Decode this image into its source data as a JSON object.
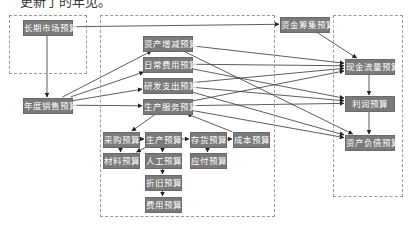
{
  "top_text": "更新了的年见。",
  "groups": [
    {
      "id": "left",
      "x": 9,
      "y": 15,
      "w": 76,
      "h": 57
    },
    {
      "id": "middle",
      "x": 100,
      "y": 15,
      "w": 173,
      "h": 200
    },
    {
      "id": "right",
      "x": 333,
      "y": 15,
      "w": 68,
      "h": 180
    }
  ],
  "nodes": [
    {
      "id": "long_market",
      "label": "长期市场预算",
      "x": 23,
      "y": 20,
      "w": 48
    },
    {
      "id": "annual_sales",
      "label": "年度销售预算",
      "x": 23,
      "y": 98,
      "w": 48
    },
    {
      "id": "asset_change",
      "label": "资产增减预算",
      "x": 143,
      "y": 36,
      "w": 48
    },
    {
      "id": "daily_expense",
      "label": "日常费用预算",
      "x": 143,
      "y": 57,
      "w": 48
    },
    {
      "id": "rd_expense",
      "label": "研发支出预算",
      "x": 143,
      "y": 78,
      "w": 48
    },
    {
      "id": "production_service",
      "label": "生产服务预算",
      "x": 143,
      "y": 99,
      "w": 48
    },
    {
      "id": "procurement",
      "label": "采购预算",
      "x": 103,
      "y": 132,
      "w": 35
    },
    {
      "id": "production",
      "label": "生产预算",
      "x": 145,
      "y": 132,
      "w": 35
    },
    {
      "id": "inventory",
      "label": "存货预算",
      "x": 190,
      "y": 132,
      "w": 35
    },
    {
      "id": "cost",
      "label": "成本预算",
      "x": 233,
      "y": 132,
      "w": 35
    },
    {
      "id": "material",
      "label": "材料预算",
      "x": 103,
      "y": 153,
      "w": 35
    },
    {
      "id": "labor",
      "label": "人工预算",
      "x": 145,
      "y": 153,
      "w": 35
    },
    {
      "id": "payable",
      "label": "应付预算",
      "x": 190,
      "y": 153,
      "w": 35
    },
    {
      "id": "depreciation",
      "label": "折旧预算",
      "x": 145,
      "y": 175,
      "w": 35
    },
    {
      "id": "expense",
      "label": "费用预算",
      "x": 145,
      "y": 197,
      "w": 35
    },
    {
      "id": "fund_raising",
      "label": "资金筹集预算",
      "x": 280,
      "y": 17,
      "w": 48
    },
    {
      "id": "cash_flow",
      "label": "现金流量预算",
      "x": 345,
      "y": 59,
      "w": 48
    },
    {
      "id": "profit",
      "label": "利润预算",
      "x": 345,
      "y": 96,
      "w": 48
    },
    {
      "id": "balance_sheet",
      "label": "资产负债预算",
      "x": 345,
      "y": 135,
      "w": 48
    }
  ],
  "edges": [
    [
      "long_market",
      "fund_raising"
    ],
    [
      "long_market",
      "annual_sales"
    ],
    [
      "annual_sales",
      "asset_change"
    ],
    [
      "annual_sales",
      "daily_expense"
    ],
    [
      "annual_sales",
      "rd_expense"
    ],
    [
      "annual_sales",
      "production_service"
    ],
    [
      "production_service",
      "procurement"
    ],
    [
      "procurement",
      "production"
    ],
    [
      "production",
      "inventory"
    ],
    [
      "inventory",
      "cost"
    ],
    [
      "procurement",
      "material"
    ],
    [
      "production",
      "material"
    ],
    [
      "production",
      "labor"
    ],
    [
      "inventory",
      "payable"
    ],
    [
      "labor",
      "depreciation"
    ],
    [
      "depreciation",
      "expense"
    ],
    [
      "cost",
      "production_service"
    ],
    [
      "fund_raising",
      "cash_flow"
    ],
    [
      "cash_flow",
      "profit"
    ],
    [
      "profit",
      "balance_sheet"
    ],
    [
      "asset_change",
      "cash_flow"
    ],
    [
      "asset_change",
      "balance_sheet"
    ],
    [
      "daily_expense",
      "cash_flow"
    ],
    [
      "daily_expense",
      "profit"
    ],
    [
      "rd_expense",
      "cash_flow"
    ],
    [
      "rd_expense",
      "profit"
    ],
    [
      "rd_expense",
      "balance_sheet"
    ],
    [
      "production_service",
      "cash_flow"
    ],
    [
      "production_service",
      "profit"
    ],
    [
      "production_service",
      "balance_sheet"
    ]
  ],
  "colors": {
    "node_fill": "#7a7a7a",
    "node_text": "#ffffff",
    "edge": "#333333",
    "group_border": "#9a9a9a"
  }
}
